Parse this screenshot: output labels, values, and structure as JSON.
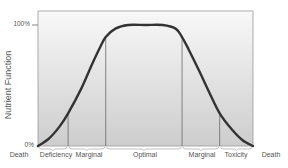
{
  "chart_data": {
    "type": "line",
    "title": "",
    "xlabel": "",
    "ylabel": "Nutrient Function",
    "y_ticks": [
      "0%",
      "100%"
    ],
    "ylim": [
      0,
      100
    ],
    "zones": [
      "Death",
      "Deficiency",
      "Marginal",
      "Optimal",
      "Marginal",
      "Toxicity",
      "Death"
    ],
    "zone_boundaries_fraction": [
      0.0,
      0.14,
      0.315,
      0.67,
      0.845,
      1.0
    ],
    "series": [
      {
        "name": "Nutrient Function",
        "x": [
          0,
          0.05,
          0.1,
          0.14,
          0.2,
          0.25,
          0.29,
          0.315,
          0.36,
          0.42,
          0.5,
          0.58,
          0.64,
          0.67,
          0.7,
          0.75,
          0.8,
          0.845,
          0.9,
          0.95,
          1.0
        ],
        "values": [
          0,
          6,
          16,
          27,
          47,
          67,
          82,
          90,
          97,
          100,
          100,
          100,
          97,
          90,
          80,
          62,
          43,
          27,
          14,
          5,
          0
        ]
      }
    ],
    "grid": false,
    "legend": "none",
    "colors": {
      "curve": "#333333",
      "background_top": "#f7f7f7",
      "background_bottom": "#cfcfcf",
      "divider": "#666666"
    }
  },
  "labels": {
    "ylabel": "Nutrient Function",
    "y100": "100%",
    "y0": "0%",
    "zones": [
      "Death",
      "Deficiency",
      "Marginal",
      "Optimal",
      "Marginal",
      "Toxicity",
      "Death"
    ]
  }
}
